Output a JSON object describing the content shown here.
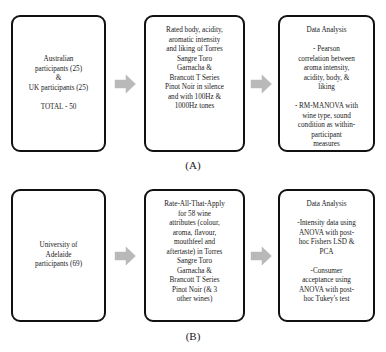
{
  "figure": {
    "arrow_color": "#b3b3b3",
    "box_border_color": "#111111",
    "text_color": "#1a1a1a"
  },
  "panels": [
    {
      "id": "A",
      "label": "(A)",
      "boxes": [
        {
          "name": "participants",
          "text": "Australian\nparticipants (25)\n&\nUK participants (25)\n\nTOTAL - 50"
        },
        {
          "name": "task",
          "text": "Rated body, acidity,\naromatic intensity\nand liking of Torres\nSangre Toro\nGarnacha &\nBrancott T Series\nPinot Noir in silence\nand with 100Hz &\n1000Hz tones"
        },
        {
          "name": "data-analysis",
          "text": "Data Analysis\n\n- Pearson\ncorrelation between\naroma intensity,\nacidity, body, &\nliking\n\n- RM-MANOVA with\nwine type, sound\ncondition as within-\nparticipant\nmeasures"
        }
      ],
      "arrows": [
        "arrow-right",
        "arrow-right"
      ]
    },
    {
      "id": "B",
      "label": "(B)",
      "boxes": [
        {
          "name": "participants",
          "text": "University of\nAdelaide\nparticipants (69)"
        },
        {
          "name": "task",
          "text": "Rate-All-That-Apply\nfor 58 wine\nattributes (colour,\naroma, flavour,\nmouthfeel and\naftertaste) in Torres\nSangre Toro\nGarnacha &\nBrancott T Series\nPinot Noir (& 3\nother wines)"
        },
        {
          "name": "data-analysis",
          "text": "Data Analysis\n\n-Intensity data using\nANOVA with post-\nhoc Fishers LSD &\nPCA\n\n-Consumer\nacceptance using\nANOVA with post-\nhoc Tukey's test"
        }
      ],
      "arrows": [
        "arrow-right",
        "arrow-right"
      ]
    }
  ]
}
